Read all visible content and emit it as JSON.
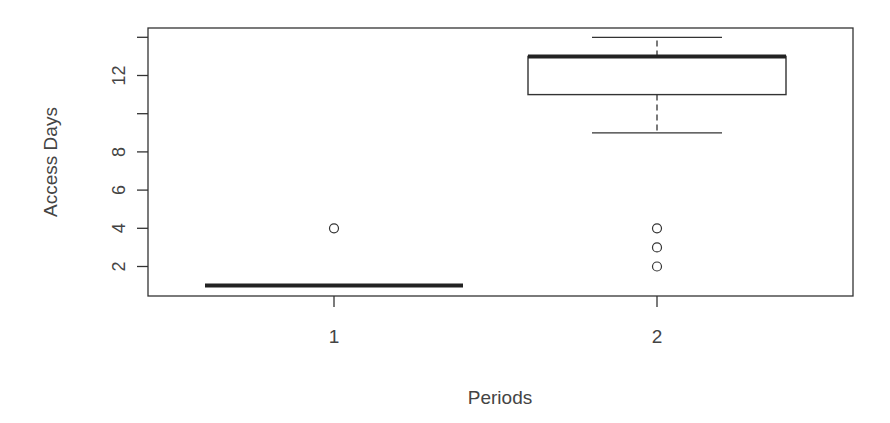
{
  "chart_data": {
    "type": "boxplot",
    "title": "",
    "xlabel": "Periods",
    "ylabel": "Access Days",
    "categories": [
      "1",
      "2"
    ],
    "y_ticks": [
      2,
      4,
      6,
      8,
      10,
      12,
      14
    ],
    "y_tick_labels": [
      "2",
      "4",
      "6",
      "8",
      "",
      "12",
      ""
    ],
    "ylim": [
      0.5,
      14.7
    ],
    "grid": false,
    "legend": null,
    "series": [
      {
        "name": "1",
        "min": 1,
        "q1": 1,
        "median": 1,
        "q3": 1,
        "max": 1,
        "outliers": [
          4
        ]
      },
      {
        "name": "2",
        "min": 9,
        "q1": 11,
        "median": 13,
        "q3": 13,
        "max": 14,
        "outliers": [
          2,
          3,
          4
        ]
      }
    ]
  },
  "axes": {
    "xlabel": "Periods",
    "ylabel": "Access Days"
  }
}
